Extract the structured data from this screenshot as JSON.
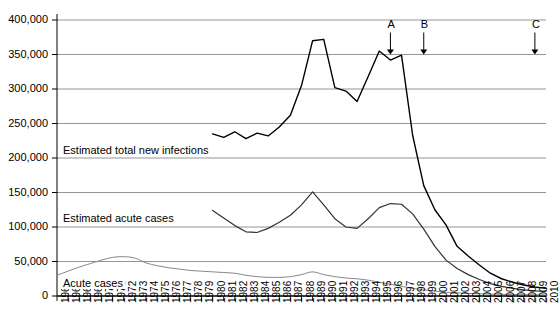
{
  "chart_data": {
    "type": "line",
    "title": "",
    "xlabel": "",
    "ylabel": "",
    "ylim": [
      0,
      400000
    ],
    "xlim": [
      1966,
      2010
    ],
    "grid": true,
    "legend_position": "inline-annotations",
    "ytick_labels": [
      "400,000",
      "350,000",
      "300,000",
      "250,000",
      "200,000",
      "150,000",
      "100,000",
      "50,000",
      "0"
    ],
    "ytick_values": [
      400000,
      350000,
      300000,
      250000,
      200000,
      150000,
      100000,
      50000,
      0
    ],
    "xtick_labels": [
      "1966",
      "1967",
      "1968",
      "1969",
      "1970",
      "1971",
      "1972",
      "1973",
      "1974",
      "1975",
      "1976",
      "1977",
      "1978",
      "1979",
      "1980",
      "1981",
      "1982",
      "1983",
      "1984",
      "1985",
      "1986",
      "1987",
      "1988",
      "1989",
      "1990",
      "1991",
      "1992",
      "1993",
      "1994",
      "1995",
      "1996",
      "1997",
      "1998",
      "1999",
      "2000",
      "2001",
      "2002",
      "2003",
      "2004",
      "2005",
      "2006",
      "2007",
      "2008",
      "2009",
      "2010"
    ],
    "x": [
      1966,
      1967,
      1968,
      1969,
      1970,
      1971,
      1972,
      1973,
      1974,
      1975,
      1976,
      1977,
      1978,
      1979,
      1980,
      1981,
      1982,
      1983,
      1984,
      1985,
      1986,
      1987,
      1988,
      1989,
      1990,
      1991,
      1992,
      1993,
      1994,
      1995,
      1996,
      1997,
      1998,
      1999,
      2000,
      2001,
      2002,
      2003,
      2004,
      2005,
      2006,
      2007,
      2008,
      2009,
      2010
    ],
    "series": [
      {
        "name": "Estimated total new infections",
        "color": "#000000",
        "width": 1.4,
        "x_start": 1980,
        "values": [
          null,
          null,
          null,
          null,
          null,
          null,
          null,
          null,
          null,
          null,
          null,
          null,
          null,
          null,
          235000,
          230000,
          238000,
          228000,
          236000,
          232000,
          245000,
          262000,
          305000,
          370000,
          372000,
          302000,
          297000,
          282000,
          318000,
          355000,
          342000,
          349000,
          233000,
          160000,
          125000,
          103000,
          72000,
          58000,
          45000,
          33000,
          25000,
          20000,
          16000,
          13000,
          11000
        ]
      },
      {
        "name": "Estimated acute cases",
        "color": "#333333",
        "width": 1.2,
        "x_start": 1980,
        "values": [
          null,
          null,
          null,
          null,
          null,
          null,
          null,
          null,
          null,
          null,
          null,
          null,
          null,
          null,
          124000,
          113000,
          102000,
          93000,
          92000,
          98000,
          107000,
          117000,
          132000,
          151000,
          132000,
          112000,
          100000,
          98000,
          112000,
          128000,
          134000,
          133000,
          119000,
          97000,
          72000,
          52000,
          40000,
          31000,
          24000,
          18000,
          14000,
          11000,
          9000,
          7500,
          6500
        ]
      },
      {
        "name": "Acute cases",
        "color": "#888888",
        "width": 1.0,
        "x_start": 1966,
        "values": [
          30000,
          36000,
          42000,
          47000,
          52000,
          56000,
          57000,
          55000,
          48000,
          44000,
          41000,
          39000,
          37000,
          36000,
          35000,
          34000,
          33000,
          30000,
          28000,
          27000,
          27000,
          28000,
          31000,
          35000,
          31000,
          28000,
          26000,
          25000,
          23000,
          20000,
          17000,
          14000,
          11000,
          9000,
          7000,
          5500,
          4500,
          3800,
          3200,
          2800,
          2400,
          2100,
          1900,
          1800,
          1700
        ]
      }
    ],
    "annotations": [
      {
        "label": "A",
        "x": 1996,
        "y_target": 350000
      },
      {
        "label": "B",
        "x": 1999,
        "y_target": 350000
      },
      {
        "label": "C",
        "x": 2009,
        "y_target": 350000
      }
    ]
  }
}
